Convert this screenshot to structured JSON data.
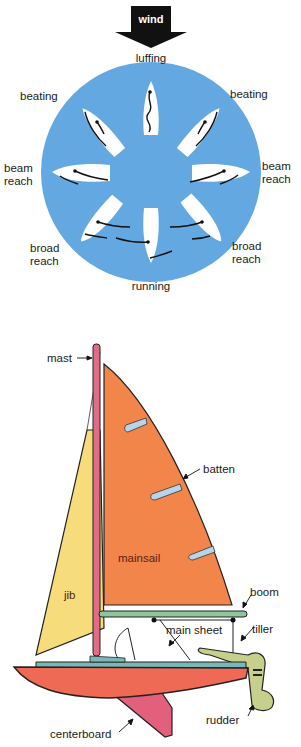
{
  "points_of_sail": {
    "wind_label": "wind",
    "labels": {
      "top": "luffing",
      "upper_left": "beating",
      "upper_right": "beating",
      "left": "beam reach",
      "right": "beam reach",
      "lower_left": "broad reach",
      "lower_right": "broad reach",
      "bottom": "running"
    },
    "colors": {
      "circle": "#64a8e2",
      "boat": "#ffffff",
      "arrow": "#111111"
    }
  },
  "sailboat_parts": {
    "labels": {
      "mast": "mast",
      "batten": "batten",
      "mainsail": "mainsail",
      "jib": "jib",
      "boom": "boom",
      "main_sheet": "main sheet",
      "tiller": "tiller",
      "centerboard": "centerboard",
      "rudder": "rudder"
    },
    "colors": {
      "mainsail": "#f2854a",
      "jib": "#f6dc7a",
      "mast": "#e06c86",
      "hull": "#ef6a55",
      "deck": "#79b8b8",
      "boom": "#8cc79c",
      "batten": "#b9d4e8",
      "tiller": "#c6d08a",
      "centerboard": "#e2607c"
    }
  }
}
